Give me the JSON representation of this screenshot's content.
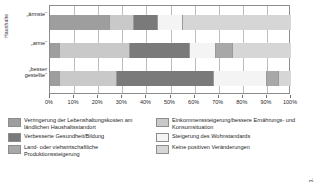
{
  "chart_data": {
    "type": "bar",
    "orientation": "horizontal",
    "stacked": true,
    "normalized_percent": true,
    "title": "",
    "xlabel": "",
    "ylabel": "Haushalte",
    "xlim": [
      0,
      100
    ],
    "xticks": [
      0,
      10,
      20,
      30,
      40,
      50,
      60,
      70,
      80,
      90,
      100
    ],
    "xticklabels": [
      "0%",
      "10%",
      "20%",
      "30%",
      "40%",
      "50%",
      "60%",
      "70%",
      "80%",
      "90%",
      "100%"
    ],
    "grid": true,
    "legend_position": "bottom",
    "categories": [
      "„ärmste“",
      "„arme“",
      "„besser gestellte“"
    ],
    "series": [
      {
        "name": "Verringerung der Lebenshaltungskosten am ländlichen Haushaltsstandort",
        "color": "#9e9e9e",
        "values": [
          25,
          4,
          4
        ]
      },
      {
        "name": "Einkommenssteigerung/bessere Ernährungs- und Konsumsituation",
        "color": "#c9c9c9",
        "values": [
          10,
          29,
          24
        ]
      },
      {
        "name": "Verbesserte Gesundheit/Bildung",
        "color": "#7a7a7a",
        "values": [
          10,
          25,
          40
        ]
      },
      {
        "name": "Steigerung des Wohnstandards",
        "color": "#f4f4f4",
        "values": [
          10,
          11,
          22
        ]
      },
      {
        "name": "Land- oder viehwirtschaftliche Produktionssteigerung",
        "color": "#a8a8a8",
        "values": [
          0,
          7,
          5
        ]
      },
      {
        "name": "Keine positiven Veränderungen",
        "color": "#d6d6d6",
        "values": [
          45,
          24,
          5
        ]
      }
    ]
  },
  "axis": {
    "y_axis_title": "Haushalte",
    "categories": [
      {
        "label": "„ärmste“",
        "lines": [
          "„ärmste“"
        ]
      },
      {
        "label": "„arme“",
        "lines": [
          "„arme“"
        ]
      },
      {
        "label": "„besser gestellte“",
        "lines": [
          "„besser",
          "gestellte“"
        ]
      }
    ],
    "xticklabels": [
      "0%",
      "10%",
      "20%",
      "30%",
      "40%",
      "50%",
      "60%",
      "70%",
      "80%",
      "90%",
      "100%"
    ]
  },
  "legend": {
    "left_column": [
      {
        "label": "Verringerung der Lebenshaltungskosten am ländlichen Haushaltsstandort",
        "color": "#9e9e9e"
      },
      {
        "label": "Verbesserte Gesundheit/Bildung",
        "color": "#7a7a7a"
      },
      {
        "label": "Land- oder viehwirtschaftliche Produktionssteigerung",
        "color": "#a8a8a8"
      }
    ],
    "right_column": [
      {
        "label": "Einkommenssteigerung/bessere Ernährungs- und Konsumsituation",
        "color": "#c9c9c9"
      },
      {
        "label": "Steigerung des Wohnstandards",
        "color": "#f4f4f4"
      },
      {
        "label": "Keine positiven Veränderungen",
        "color": "#d6d6d6"
      }
    ]
  },
  "source": {
    "text": "Quelle: Steinwandter, Winterhalder 2017: 223."
  }
}
